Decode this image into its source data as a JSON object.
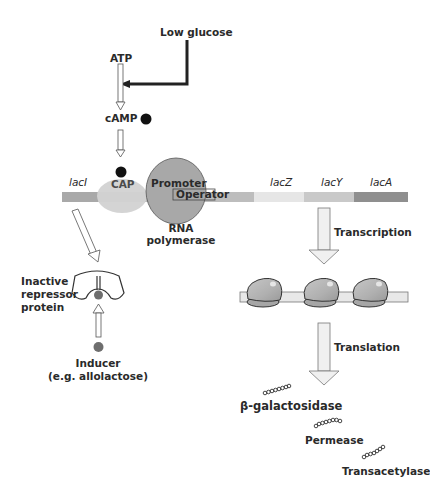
{
  "signals": {
    "low_glucose": "Low glucose",
    "atp": "ATP",
    "camp": "cAMP"
  },
  "dna": {
    "genes": [
      {
        "label": "lacI",
        "color": "#a9a9a9"
      },
      {
        "label": "lacZ",
        "color": "#e6e6e6"
      },
      {
        "label": "lacY",
        "color": "#c9c9c9"
      },
      {
        "label": "lacA",
        "color": "#8f8f8f"
      }
    ],
    "cap_label": "CAP",
    "promoter_label": "Promoter",
    "operator_label": "Operator",
    "rna_polymerase_label": [
      "RNA",
      "polymerase"
    ]
  },
  "repressor": {
    "label": [
      "Inactive",
      "repressor",
      "protein"
    ],
    "inducer_label": [
      "Inducer",
      "(e.g. allolactose)"
    ]
  },
  "process": {
    "transcription": "Transcription",
    "translation": "Translation"
  },
  "products": [
    {
      "label": "β-galactosidase"
    },
    {
      "label": "Permease"
    },
    {
      "label": "Transacetylase"
    }
  ],
  "colors": {
    "dna_bar": "#bdbdbd",
    "cap": "#cfcfcf",
    "rna_polymerase": "#a8a8a8",
    "ribosome": "#b3b3b3",
    "mrna": "#e8e8e8",
    "camp_dot": "#111111",
    "inducer_dot": "#6e6e6e"
  }
}
